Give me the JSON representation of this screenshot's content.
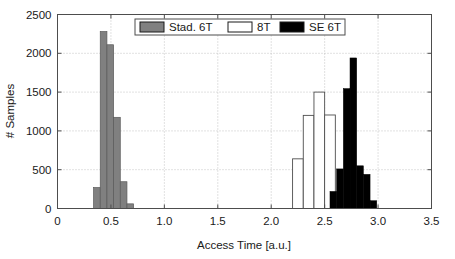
{
  "chart_data": {
    "type": "bar",
    "title": "",
    "subtitle": "",
    "xlabel": "Access Time [a.u.]",
    "ylabel": "# Samples",
    "xlim": [
      0,
      3.5
    ],
    "ylim": [
      0,
      2500
    ],
    "xticks": [
      0,
      0.5,
      1.0,
      1.5,
      2.0,
      2.5,
      3.0,
      3.5
    ],
    "xticklabels": [
      "0",
      "0.5",
      "1.0",
      "1.5",
      "2.0",
      "2.5",
      "3.0",
      "3.5"
    ],
    "yticks": [
      0,
      500,
      1000,
      1500,
      2000,
      2500
    ],
    "yticklabels": [
      "0",
      "500",
      "1000",
      "1500",
      "2000",
      "2500"
    ],
    "grid": true,
    "grid_style": "dotted",
    "legend_position": "top-center",
    "bin_width": 0.0625,
    "series": [
      {
        "name": "Stad. 6T",
        "color": "#808080",
        "edge_color": "#5a5a5a",
        "bin_starts": [
          0.3375,
          0.4,
          0.4625,
          0.525,
          0.5875,
          0.65,
          0.7125,
          0.775,
          0.8375,
          0.9
        ],
        "bin_centers": [
          0.369,
          0.431,
          0.494,
          0.556,
          0.619,
          0.681,
          0.744,
          0.806,
          0.869,
          0.931
        ],
        "values": [
          270,
          2280,
          2110,
          1175,
          345,
          60,
          0,
          0,
          0,
          0
        ]
      },
      {
        "name": "8T",
        "color": "#ffffff",
        "edge_color": "#4d4d4d",
        "bin_starts": [
          2.0,
          2.1,
          2.2,
          2.3,
          2.4,
          2.5
        ],
        "bin_centers": [
          2.05,
          2.15,
          2.25,
          2.35,
          2.45,
          2.55
        ],
        "values": [
          0,
          0,
          640,
          1200,
          1500,
          1205
        ]
      },
      {
        "name": "SE 6T",
        "color": "#000000",
        "edge_color": "#000000",
        "bin_starts": [
          2.425,
          2.4875,
          2.55,
          2.6125,
          2.675,
          2.7375,
          2.8,
          2.8625,
          2.925,
          2.9875,
          3.05,
          3.1125
        ],
        "bin_centers": [
          2.456,
          2.519,
          2.581,
          2.644,
          2.706,
          2.769,
          2.831,
          2.894,
          2.956,
          3.019,
          3.081,
          3.144
        ],
        "values": [
          0,
          0,
          220,
          510,
          1545,
          1940,
          550,
          440,
          100,
          0,
          0,
          0
        ]
      }
    ]
  },
  "legend": {
    "items": [
      {
        "label": "Stad. 6T",
        "color": "#808080"
      },
      {
        "label": "8T",
        "color": "#ffffff"
      },
      {
        "label": "SE 6T",
        "color": "#000000"
      }
    ]
  },
  "axes": {
    "x_label": "Access Time [a.u.]",
    "y_label": "# Samples"
  }
}
